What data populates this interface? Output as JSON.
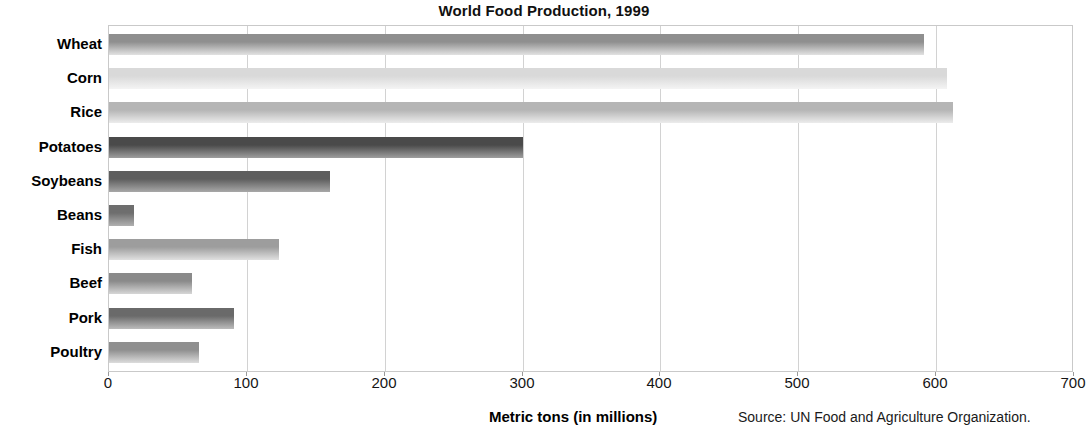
{
  "chart_data": {
    "type": "bar",
    "orientation": "horizontal",
    "title": "World Food Production, 1999",
    "xlabel": "Metric tons (in millions)",
    "ylabel": "",
    "xlim": [
      0,
      700
    ],
    "xticks": [
      0,
      100,
      200,
      300,
      400,
      500,
      600,
      700
    ],
    "grid": true,
    "legend": null,
    "source": "Source: UN Food and Agriculture Organization.",
    "categories": [
      "Wheat",
      "Corn",
      "Rice",
      "Potatoes",
      "Soybeans",
      "Beans",
      "Fish",
      "Beef",
      "Pork",
      "Poultry"
    ],
    "values": [
      591,
      608,
      612,
      300,
      160,
      18,
      123,
      60,
      91,
      65
    ],
    "bar_colors_top": [
      "#8f8f8f",
      "#d9d9d9",
      "#b5b5b5",
      "#4a4a4a",
      "#5e5e5e",
      "#6e6e6e",
      "#9d9d9d",
      "#8a8a8a",
      "#6a6a6a",
      "#8f8f8f"
    ],
    "bar_colors_bottom": [
      "#e2e2e2",
      "#f4f4f4",
      "#ececec",
      "#9e9e9e",
      "#a8a8a8",
      "#b0b0b0",
      "#e0e0e0",
      "#d6d6d6",
      "#bcbcbc",
      "#dcdcdc"
    ]
  },
  "colors": {
    "plot_border": "#c9c9c9",
    "gridline": "#d2d2d2",
    "text": "#000000"
  }
}
